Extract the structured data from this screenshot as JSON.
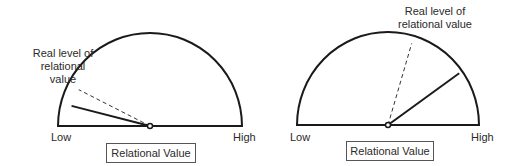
{
  "gauges": [
    {
      "id": "left",
      "low_label": "Low",
      "high_label": "High",
      "caption": "Relational Value",
      "annotation": [
        "Real level of",
        "relational",
        "value"
      ],
      "perceived_value": 0.08,
      "real_value": 0.15
    },
    {
      "id": "right",
      "low_label": "Low",
      "high_label": "High",
      "caption": "Relational Value",
      "annotation": [
        "Real level of",
        "relational value"
      ],
      "perceived_value": 0.8,
      "real_value": 0.59
    }
  ],
  "colors": {
    "stroke": "#1a1a1a",
    "dashed": "#333333",
    "box_border": "#555555"
  }
}
